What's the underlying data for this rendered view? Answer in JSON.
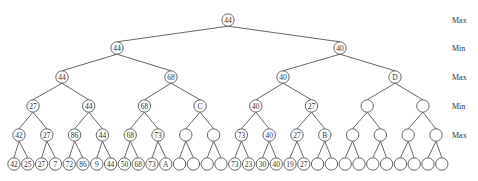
{
  "diagram": {
    "type": "minimax-game-tree",
    "level_labels": [
      "Max",
      "Min",
      "Max",
      "Min",
      "Max"
    ],
    "levels": [
      [
        "44"
      ],
      [
        "44",
        "40"
      ],
      [
        "44",
        "68",
        "40",
        "D"
      ],
      [
        "27",
        "44",
        "68",
        "C",
        "40",
        "27",
        "",
        ""
      ],
      [
        "42",
        "27",
        "86",
        "44",
        "68",
        "73",
        "",
        "",
        "73",
        "40",
        "27",
        "B",
        "",
        "",
        "",
        ""
      ],
      [
        "42",
        "25",
        "27",
        "7",
        "72",
        "86",
        "9",
        "44",
        "50",
        "68",
        "73",
        "A",
        "",
        "",
        "",
        "",
        "73",
        "23",
        "30",
        "40",
        "19",
        "27",
        "",
        "",
        "",
        "",
        "",
        "",
        "",
        "",
        "",
        ""
      ]
    ]
  }
}
